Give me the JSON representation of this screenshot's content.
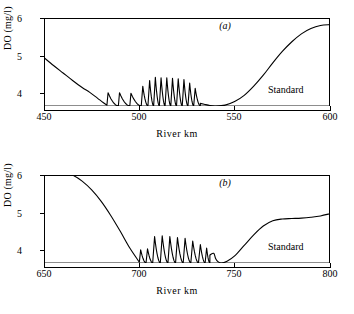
{
  "figure": {
    "background": "#ffffff",
    "line_color": "#000000"
  },
  "chart_data": [
    {
      "type": "line",
      "panel": "(a)",
      "title": "(a)",
      "xlabel": "River  km",
      "ylabel": "DO (mg/l)",
      "xlim": [
        450,
        600
      ],
      "ylim": [
        4,
        6
      ],
      "xticks": [
        450,
        500,
        550,
        600
      ],
      "xticklabels": [
        "450",
        "500",
        "550",
        "600"
      ],
      "yticks": [
        4,
        5,
        6
      ],
      "yticklabels": [
        "4",
        "5",
        "6"
      ],
      "grid": false,
      "legend": "none",
      "annotations": [
        {
          "text": "Standard",
          "x": 572,
          "y": 4.12,
          "note": "label above the horizontal standard line"
        },
        {
          "text": "(a)",
          "x": 525,
          "y": 5.75,
          "note": "panel identifier"
        }
      ],
      "reference_lines": [
        {
          "name": "Standard",
          "orientation": "horizontal",
          "y": 4.0,
          "label": "Standard"
        }
      ],
      "series": [
        {
          "name": "Dissolved oxygen profile (a)",
          "description": "Smooth decline from 5.1 mg/l at km 450 to the 4.0 standard at km 483, a sawtooth reaeration zone from km 483 to km 532 with peaks growing to 4.65 then decaying, a flat minimum at 4.0 near km 540, and an S-shaped recovery to 5.85 at km 600.",
          "x": [
            450,
            455,
            460,
            465,
            470,
            474,
            478,
            481,
            483,
            532,
            534,
            537,
            540,
            545,
            550,
            555,
            560,
            565,
            570,
            575,
            580,
            585,
            590,
            595,
            600
          ],
          "y": [
            5.1,
            4.92,
            4.75,
            4.58,
            4.42,
            4.31,
            4.18,
            4.08,
            4.02,
            4.06,
            4.04,
            4.01,
            4.0,
            4.02,
            4.1,
            4.24,
            4.45,
            4.7,
            4.98,
            5.24,
            5.46,
            5.64,
            5.76,
            5.83,
            5.85
          ]
        }
      ],
      "sawtooth": {
        "description": "Series of sharp rises followed by gradual exponential-like declines back toward the 4.0 standard.",
        "baseline": 4.0,
        "teeth": [
          {
            "x_start": 483.0,
            "x_peak": 483.6,
            "peak": 4.3,
            "x_end": 489.0
          },
          {
            "x_start": 489.0,
            "x_peak": 489.6,
            "peak": 4.3,
            "x_end": 495.0
          },
          {
            "x_start": 495.0,
            "x_peak": 495.6,
            "peak": 4.29,
            "x_end": 501.0
          },
          {
            "x_start": 501.0,
            "x_peak": 501.8,
            "peak": 4.45,
            "x_end": 504.5
          },
          {
            "x_start": 504.5,
            "x_peak": 505.4,
            "peak": 4.58,
            "x_end": 507.5
          },
          {
            "x_start": 507.5,
            "x_peak": 508.4,
            "peak": 4.65,
            "x_end": 510.5
          },
          {
            "x_start": 510.5,
            "x_peak": 511.4,
            "peak": 4.64,
            "x_end": 513.5
          },
          {
            "x_start": 513.5,
            "x_peak": 514.4,
            "peak": 4.64,
            "x_end": 516.5
          },
          {
            "x_start": 516.5,
            "x_peak": 517.4,
            "peak": 4.63,
            "x_end": 519.5
          },
          {
            "x_start": 519.5,
            "x_peak": 520.4,
            "peak": 4.62,
            "x_end": 522.5
          },
          {
            "x_start": 522.5,
            "x_peak": 523.4,
            "peak": 4.6,
            "x_end": 525.5
          },
          {
            "x_start": 525.5,
            "x_peak": 526.4,
            "peak": 4.52,
            "x_end": 528.5
          },
          {
            "x_start": 528.5,
            "x_peak": 529.3,
            "peak": 4.4,
            "x_end": 532.0
          }
        ]
      }
    },
    {
      "type": "line",
      "panel": "(b)",
      "title": "(b)",
      "xlabel": "River  km",
      "ylabel": "DO (mg/l)",
      "xlim": [
        650,
        800
      ],
      "ylim": [
        4,
        6
      ],
      "xticks": [
        650,
        700,
        750,
        800
      ],
      "xticklabels": [
        "650",
        "700",
        "750",
        "800"
      ],
      "yticks": [
        4,
        5,
        6
      ],
      "yticklabels": [
        "4",
        "5",
        "6"
      ],
      "grid": false,
      "legend": "none",
      "annotations": [
        {
          "text": "Standard",
          "x": 772,
          "y": 4.12,
          "note": "label above the horizontal standard line"
        },
        {
          "text": "(b)",
          "x": 725,
          "y": 5.75,
          "note": "panel identifier"
        }
      ],
      "reference_lines": [
        {
          "name": "Standard",
          "orientation": "horizontal",
          "y": 4.0,
          "label": "Standard"
        }
      ],
      "series": [
        {
          "name": "Dissolved oxygen profile (b)",
          "description": "Starts at 6.1 mg/l at km 650, holds briefly, then falls steeply in a sigmoid to the 4.0 standard at km 700; sawtooth reaeration zone from km 700 to km 737 with peaks near 4.62; a short notch then a minimum of 4.0 near km 743, followed by recovery to 5.1 at km 800.",
          "x": [
            650,
            655,
            660,
            665,
            670,
            675,
            680,
            685,
            690,
            695,
            700,
            737,
            739,
            740,
            741,
            743,
            746,
            750,
            755,
            760,
            765,
            770,
            775,
            780,
            785,
            790,
            795,
            800
          ],
          "y": [
            6.1,
            6.11,
            6.08,
            6.0,
            5.86,
            5.66,
            5.4,
            5.08,
            4.72,
            4.34,
            4.02,
            4.18,
            4.22,
            4.1,
            4.04,
            4.0,
            4.04,
            4.16,
            4.4,
            4.64,
            4.84,
            4.96,
            5.0,
            5.01,
            5.02,
            5.04,
            5.07,
            5.12
          ]
        }
      ],
      "sawtooth": {
        "description": "Series of sharp rises followed by gradual declines back toward the 4.0 standard.",
        "baseline": 4.0,
        "teeth": [
          {
            "x_start": 700.0,
            "x_peak": 700.7,
            "peak": 4.3,
            "x_end": 703.5
          },
          {
            "x_start": 703.5,
            "x_peak": 704.3,
            "peak": 4.32,
            "x_end": 707.0
          },
          {
            "x_start": 707.0,
            "x_peak": 708.0,
            "peak": 4.6,
            "x_end": 711.0
          },
          {
            "x_start": 711.0,
            "x_peak": 712.0,
            "peak": 4.62,
            "x_end": 715.0
          },
          {
            "x_start": 715.0,
            "x_peak": 716.0,
            "peak": 4.6,
            "x_end": 719.0
          },
          {
            "x_start": 719.0,
            "x_peak": 720.0,
            "peak": 4.58,
            "x_end": 723.0
          },
          {
            "x_start": 723.0,
            "x_peak": 724.0,
            "peak": 4.56,
            "x_end": 727.0
          },
          {
            "x_start": 727.0,
            "x_peak": 728.0,
            "peak": 4.5,
            "x_end": 731.0
          },
          {
            "x_start": 731.0,
            "x_peak": 732.0,
            "peak": 4.42,
            "x_end": 734.5
          },
          {
            "x_start": 734.5,
            "x_peak": 735.3,
            "peak": 4.34,
            "x_end": 737.0
          }
        ]
      }
    }
  ],
  "panel_a": {
    "tag": "(a)",
    "ylabel": "DO (mg/l)",
    "xlabel": "River  km",
    "standard_label": "Standard",
    "yticklabels": [
      "6",
      "5",
      "4"
    ],
    "xticklabels": [
      "450",
      "500",
      "550",
      "600"
    ]
  },
  "panel_b": {
    "tag": "(b)",
    "ylabel": "DO (mg/l)",
    "xlabel": "River  km",
    "standard_label": "Standard",
    "yticklabels": [
      "6",
      "5",
      "4"
    ],
    "xticklabels": [
      "650",
      "700",
      "750",
      "800"
    ]
  }
}
